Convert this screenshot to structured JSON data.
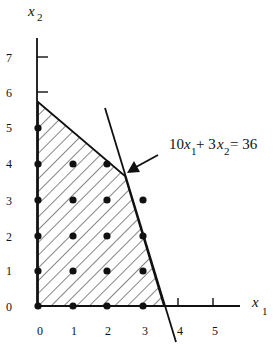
{
  "diagram": {
    "type": "linear-programming-feasible-region",
    "x_axis": {
      "label": "x",
      "subscript": "1",
      "ticks": [
        "0",
        "1",
        "2",
        "3",
        "4",
        "5"
      ]
    },
    "y_axis": {
      "label": "x",
      "subscript": "2",
      "ticks": [
        "0",
        "1",
        "2",
        "3",
        "4",
        "5",
        "6",
        "7"
      ]
    },
    "constraint_label": {
      "coef1": "10",
      "var1": "x",
      "sub1": "1",
      "plus": "+ 3",
      "var2": "x",
      "sub2": "2",
      "rhs": "= 36"
    },
    "feasible_region_vertices": [
      [
        0,
        0
      ],
      [
        0,
        5.75
      ],
      [
        2.5,
        3.67
      ],
      [
        3.6,
        0
      ]
    ],
    "constraint_line": {
      "from": [
        2.05,
        5.6
      ],
      "to": [
        3.9,
        -1.0
      ],
      "equation": "10x1 + 3x2 = 36"
    },
    "integer_points": [
      [
        0,
        0
      ],
      [
        1,
        0
      ],
      [
        2,
        0
      ],
      [
        3,
        0
      ],
      [
        0,
        1
      ],
      [
        1,
        1
      ],
      [
        2,
        1
      ],
      [
        3,
        1
      ],
      [
        0,
        2
      ],
      [
        1,
        2
      ],
      [
        2,
        2
      ],
      [
        3,
        2
      ],
      [
        0,
        3
      ],
      [
        1,
        3
      ],
      [
        2,
        3
      ],
      [
        3,
        3
      ],
      [
        0,
        4
      ],
      [
        1,
        4
      ],
      [
        2,
        4
      ],
      [
        0,
        5
      ]
    ],
    "colors": {
      "stroke": "#111111",
      "hatch": "#222222",
      "background": "#ffffff"
    }
  }
}
